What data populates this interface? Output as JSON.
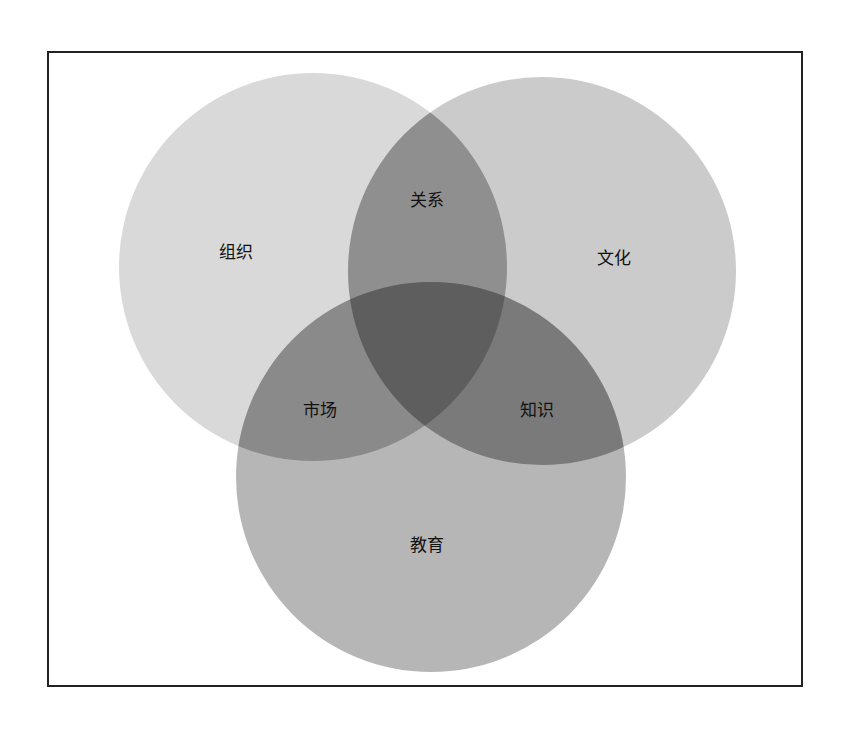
{
  "diagram": {
    "type": "venn-3",
    "frame": true,
    "sets": [
      {
        "id": "org",
        "label": "组织",
        "cx": 313,
        "cy": 267,
        "r": 194,
        "color": "#d6d6d6"
      },
      {
        "id": "culture",
        "label": "文化",
        "cx": 542,
        "cy": 271,
        "r": 194,
        "color": "#c9c9c9"
      },
      {
        "id": "education",
        "label": "教育",
        "cx": 431,
        "cy": 477,
        "r": 195,
        "color": "#b4b4b4"
      }
    ],
    "intersections": [
      {
        "sets": [
          "org",
          "culture"
        ],
        "label": "关系"
      },
      {
        "sets": [
          "org",
          "education"
        ],
        "label": "市场"
      },
      {
        "sets": [
          "culture",
          "education"
        ],
        "label": "知识"
      },
      {
        "sets": [
          "org",
          "culture",
          "education"
        ],
        "label": ""
      }
    ],
    "labels": {
      "org": "组织",
      "culture": "文化",
      "education": "教育",
      "relationship": "关系",
      "market": "市场",
      "knowledge": "知识"
    }
  }
}
